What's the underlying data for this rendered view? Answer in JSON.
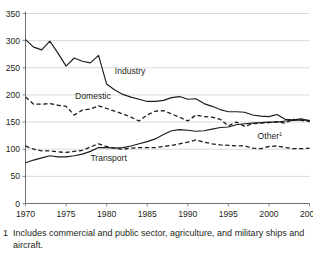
{
  "figure": {
    "title_fragment": "",
    "footnote_marker": "1",
    "footnote_text": "Includes commercial and public sector, agriculture, and military ships and aircraft."
  },
  "chart_data": {
    "type": "line",
    "title": "",
    "subtitle": "",
    "xlabel": "",
    "ylabel": "",
    "xlim": [
      1970,
      2005
    ],
    "ylim": [
      0,
      350
    ],
    "grid": true,
    "legend_position": "inline-labels",
    "x_ticks": [
      "1970",
      "1975",
      "1980",
      "1985",
      "1990",
      "1995",
      "2000",
      "2005"
    ],
    "x_tick_values": [
      1970,
      1975,
      1980,
      1985,
      1990,
      1995,
      2000,
      2005
    ],
    "y_ticks": [
      "0",
      "50",
      "100",
      "150",
      "200",
      "250",
      "300",
      "350"
    ],
    "y_tick_values": [
      0,
      50,
      100,
      150,
      200,
      250,
      300,
      350
    ],
    "x": [
      1970,
      1971,
      1972,
      1973,
      1974,
      1975,
      1976,
      1977,
      1978,
      1979,
      1980,
      1981,
      1982,
      1983,
      1984,
      1985,
      1986,
      1987,
      1988,
      1989,
      1990,
      1991,
      1992,
      1993,
      1994,
      1995,
      1996,
      1997,
      1998,
      1999,
      2000,
      2001,
      2002,
      2003,
      2004,
      2005
    ],
    "series": [
      {
        "name": "Industry",
        "style": "solid",
        "label": "Industry",
        "label_x": 1981.0,
        "label_y": 238,
        "values": [
          302,
          288,
          283,
          299,
          277,
          253,
          268,
          262,
          259,
          273,
          220,
          209,
          201,
          196,
          192,
          188,
          188,
          190,
          195,
          197,
          192,
          193,
          184,
          179,
          173,
          169,
          169,
          168,
          163,
          161,
          160,
          164,
          155,
          154,
          156,
          152
        ]
      },
      {
        "name": "Domestic",
        "style": "dashed",
        "label": "Domestic",
        "label_x": 1976.1,
        "label_y": 192,
        "values": [
          196,
          183,
          183,
          184,
          181,
          179,
          163,
          172,
          174,
          180,
          175,
          170,
          165,
          159,
          152,
          163,
          170,
          171,
          165,
          159,
          152,
          163,
          160,
          159,
          155,
          143,
          150,
          142,
          147,
          148,
          149,
          151,
          148,
          155,
          153,
          151
        ]
      },
      {
        "name": "Transport",
        "style": "solid",
        "label": "Transport",
        "label_x": 1978.0,
        "label_y": 79,
        "values": [
          75,
          80,
          84,
          88,
          86,
          86,
          88,
          91,
          96,
          103,
          103,
          102,
          103,
          106,
          110,
          114,
          119,
          127,
          134,
          136,
          135,
          133,
          134,
          137,
          140,
          141,
          145,
          147,
          148,
          149,
          150,
          150,
          152,
          153,
          154,
          153
        ]
      },
      {
        "name": "Other",
        "style": "dashed",
        "label": "Other",
        "label_superscript": "1",
        "label_x": 1998.6,
        "label_y": 119,
        "values": [
          106,
          100,
          97,
          97,
          95,
          94,
          96,
          98,
          104,
          110,
          105,
          102,
          100,
          102,
          103,
          103,
          103,
          105,
          107,
          110,
          113,
          117,
          113,
          110,
          108,
          107,
          106,
          106,
          102,
          101,
          105,
          106,
          103,
          101,
          101,
          102
        ]
      }
    ]
  }
}
